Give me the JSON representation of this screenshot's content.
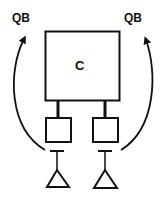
{
  "diagram": {
    "left_label": "QB",
    "right_label": "QB",
    "main_box_label": "C",
    "stroke_color": "#111111",
    "background": "#ffffff",
    "components": {
      "main_box": {
        "label": "C"
      },
      "sub_boxes": [
        {
          "id": "left-sub-box"
        },
        {
          "id": "right-sub-box"
        }
      ],
      "antennas": [
        {
          "id": "left-antenna"
        },
        {
          "id": "right-antenna"
        }
      ],
      "arrows": [
        {
          "id": "left-curved-arrow",
          "target": "QB"
        },
        {
          "id": "right-curved-arrow",
          "target": "QB"
        }
      ]
    }
  }
}
